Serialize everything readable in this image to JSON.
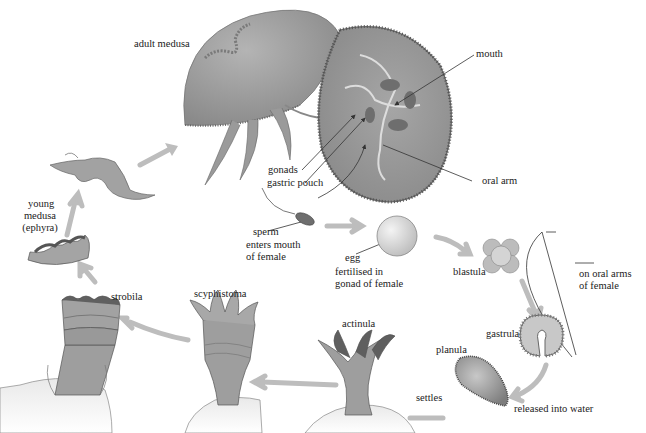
{
  "diagram": {
    "colors": {
      "body": "#9a9a9a",
      "body_light": "#c8c8c8",
      "body_dark": "#6a6a6a",
      "arrow": "#bdbdbd",
      "pointer": "#333333",
      "text": "#222222",
      "background": "#ffffff"
    },
    "labels": {
      "adult_medusa": "adult medusa",
      "mouth": "mouth",
      "oral_arm": "oral arm",
      "gonads": "gonads",
      "gastric_pouch": "gastric pouch",
      "sperm": "sperm",
      "sperm_note_1": "enters mouth",
      "sperm_note_2": "of female",
      "egg": "egg",
      "egg_note_1": "fertilised in",
      "egg_note_2": "gonad of female",
      "blastula": "blastula",
      "on_oral_arms_1": "on oral arms",
      "on_oral_arms_2": "of female",
      "gastrula": "gastrula",
      "planula": "planula",
      "released": "released into water",
      "settles": "settles",
      "actinula": "actinula",
      "scyphistoma": "scyphistoma",
      "strobila": "strobila",
      "young_medusa_1": "young",
      "young_medusa_2": "medusa",
      "young_medusa_3": "(ephyra)"
    },
    "stages": [
      "adult medusa",
      "sperm",
      "egg",
      "blastula",
      "gastrula",
      "planula",
      "actinula",
      "scyphistoma",
      "strobila",
      "young medusa (ephyra)"
    ]
  }
}
